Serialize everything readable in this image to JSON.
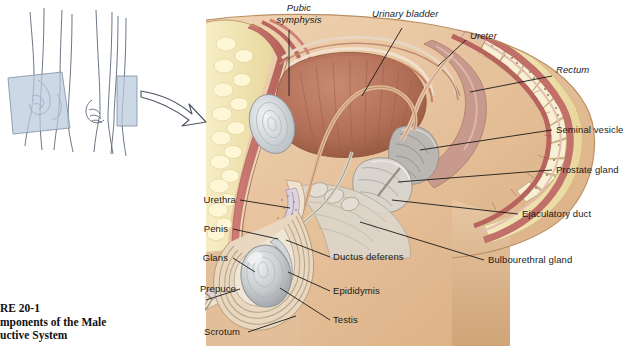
{
  "figure": {
    "background_color": "#ffffff",
    "caption": {
      "clipped_left": true,
      "line1": "RE 20-1",
      "line2": "mponents of the Male",
      "line3": "uctive System",
      "full_intended_line1": "FIGURE 20-1",
      "full_intended_line2": "Components of the Male",
      "full_intended_line3": "Reproductive System"
    },
    "labels_italic": [
      {
        "id": "pubic-symphysis",
        "text_line1": "Pubic",
        "text_line2": "symphysis",
        "x": 268,
        "y": 4
      },
      {
        "id": "urinary-bladder",
        "text": "Urinary bladder",
        "x": 372,
        "y": 11
      },
      {
        "id": "ureter",
        "text": "Ureter",
        "x": 470,
        "y": 33
      },
      {
        "id": "rectum",
        "text": "Rectum",
        "x": 556,
        "y": 69
      }
    ],
    "labels_right": [
      {
        "id": "seminal-vesicle",
        "text": "Seminal vesicle",
        "x": 556,
        "y": 126
      },
      {
        "id": "prostate-gland",
        "text": "Prostate gland",
        "x": 556,
        "y": 166
      },
      {
        "id": "ejaculatory-duct",
        "text": "Ejaculatory duct",
        "x": 522,
        "y": 210
      },
      {
        "id": "bulbourethral-gland",
        "text": "Bulbourethral gland",
        "x": 488,
        "y": 256
      }
    ],
    "labels_left": [
      {
        "id": "urethra",
        "text": "Urethra",
        "x": 199,
        "y": 197
      },
      {
        "id": "penis",
        "text": "Penis",
        "x": 199,
        "y": 226
      },
      {
        "id": "glans",
        "text": "Glans",
        "x": 199,
        "y": 255
      },
      {
        "id": "prepuce",
        "text": "Prepuce",
        "x": 199,
        "y": 286
      }
    ],
    "labels_inner": [
      {
        "id": "ductus-deferens",
        "text": "Ductus deferens",
        "x": 333,
        "y": 254
      },
      {
        "id": "epididymis",
        "text": "Epididymis",
        "x": 333,
        "y": 288
      },
      {
        "id": "testis",
        "text": "Testis",
        "x": 333,
        "y": 317
      },
      {
        "id": "scrotum",
        "text": "Scrotum",
        "x": 204,
        "y": 329
      }
    ],
    "insets": {
      "description": "two orientation line drawings of a standing male torso/legs with a sectional plane",
      "plane_color": "#b8c9dd",
      "outline_color": "#5b6676",
      "arrow": "curved-arrow-right"
    },
    "palette": {
      "skin": "#e5c09a",
      "skin_deep": "#d8ab80",
      "fat": "#f2e6b8",
      "muscle_red": "#c4706a",
      "bladder": "#b5705a",
      "bone_gray": "#cfd3d6",
      "testis_gray": "#c9ccce",
      "rectum_pink": "#c99a8e",
      "vesicle_gray": "#b9b6b4",
      "leader": "#1b1b1b"
    }
  }
}
